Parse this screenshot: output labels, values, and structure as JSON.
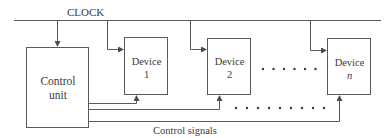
{
  "diagram": {
    "clock_label": "CLOCK",
    "control_unit": {
      "line1": "Control",
      "line2": "unit"
    },
    "devices": [
      {
        "name": "Device",
        "index": "1"
      },
      {
        "name": "Device",
        "index": "2"
      },
      {
        "name": "Device",
        "index": "n"
      }
    ],
    "control_signals_label": "Control signals",
    "ellipsis_upper": "• • • • • •",
    "ellipsis_lower": "• • • • • • • • •",
    "colors": {
      "line": "#4a4a4a",
      "text": "#3a3a3a",
      "background": "#ffffff"
    }
  }
}
